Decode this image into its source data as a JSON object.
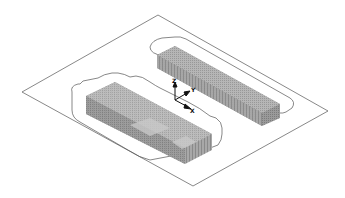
{
  "drawing": {
    "view": "isometric",
    "colors": {
      "background": "#ffffff",
      "outline": "#555555",
      "block_dark": "#7a7a7a",
      "block_light": "#b0b0b0",
      "axis": "#111111"
    }
  },
  "axes": {
    "z_label": "Z",
    "y_label": "Y",
    "x_label": "X"
  }
}
